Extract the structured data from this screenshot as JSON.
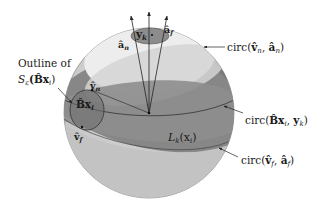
{
  "diagram": {
    "type": "sphere-geometry-figure",
    "colors": {
      "background": "#ffffff",
      "sphere_light": "#c9c9c9",
      "sphere_lower": "#bcbcbc",
      "band_dark": "#7e7e7e",
      "band_mid": "#9a9a9a",
      "cap_white": "#ececec",
      "cap_inner": "#d6d6d6",
      "small_circle": "#8a8a8a",
      "line": "#222222"
    },
    "labels": {
      "outline_line1": "Outline of",
      "outline_line2_main": "S",
      "outline_line2_sub": "ε",
      "outline_line2_arg": "(B̂x",
      "outline_line2_argsub": "i",
      "outline_line2_close": ")",
      "bx_inner": "B̂x",
      "bx_inner_sub": "i",
      "v_n": "v̂",
      "v_n_sub": "n",
      "v_f": "v̂",
      "v_f_sub": "f",
      "a_n": "â",
      "a_n_sub": "n",
      "a_f": "â",
      "a_f_sub": "f",
      "y_k": "y",
      "y_k_sub": "k",
      "L_k_main": "L",
      "L_k_sub": "k",
      "L_k_arg": "(x",
      "L_k_argsub": "i",
      "L_k_close": ")"
    },
    "callouts": [
      {
        "id": "circ-vn-an",
        "prefix": "circ(",
        "a": "v̂",
        "a_sub": "n",
        "sep": ", ",
        "b": "â",
        "b_sub": "n",
        "suffix": ")"
      },
      {
        "id": "circ-bx-yk",
        "prefix": "circ(",
        "a": "B̂x",
        "a_sub": "i",
        "sep": ", ",
        "b": "y",
        "b_sub": "k",
        "suffix": ")"
      },
      {
        "id": "circ-vf-af",
        "prefix": "circ(",
        "a": "v̂",
        "a_sub": "f",
        "sep": ", ",
        "b": "â",
        "b_sub": "f",
        "suffix": ")"
      }
    ]
  }
}
